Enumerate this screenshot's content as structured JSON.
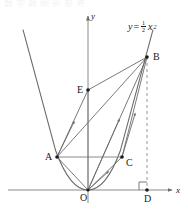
{
  "figure": {
    "type": "coordinate-geometry-diagram",
    "background_color": "#ffffff",
    "stroke_color": "#6b6b6b",
    "text_color": "#1a1a1a",
    "top_cut_text": "数学题图形参考",
    "curve": {
      "equation_label": "y = 1/2 x²",
      "equation_parts": {
        "y": "y",
        "equals": "=",
        "numerator": "1",
        "denominator": "2",
        "variable": "x",
        "exponent": "2"
      },
      "coefficient": 0.5,
      "vertex_point": "O"
    },
    "axes": {
      "x_label": "x",
      "y_label": "y",
      "x_axis_arrow": "arrow-right",
      "y_axis_arrow": "arrow-up"
    },
    "points": [
      {
        "name": "O",
        "label": "O",
        "x": -0.0,
        "y": 0.0,
        "label_pos": "below-left"
      },
      {
        "name": "A",
        "label": "A",
        "x": -2.6,
        "y": 3.3,
        "label_pos": "left"
      },
      {
        "name": "B",
        "label": "B",
        "x": 5.0,
        "y": 13.3,
        "label_pos": "right"
      },
      {
        "name": "C",
        "label": "C",
        "x": 2.8,
        "y": 3.3,
        "label_pos": "right"
      },
      {
        "name": "D",
        "label": "D",
        "x": 5.0,
        "y": 0.0,
        "label_pos": "below"
      },
      {
        "name": "E",
        "label": "E",
        "x": 0.0,
        "y": 10.0,
        "label_pos": "left"
      }
    ],
    "segments": [
      {
        "from": "A",
        "to": "C",
        "style": "solid",
        "arrow": "none"
      },
      {
        "from": "A",
        "to": "B",
        "style": "solid",
        "arrow": "mid"
      },
      {
        "from": "A",
        "to": "E",
        "style": "solid",
        "arrow": "mid"
      },
      {
        "from": "E",
        "to": "B",
        "style": "solid",
        "arrow": "none"
      },
      {
        "from": "O",
        "to": "B",
        "style": "solid",
        "arrow": "mid"
      },
      {
        "from": "O",
        "to": "E",
        "style": "solid",
        "arrow": "none"
      },
      {
        "from": "O",
        "to": "C",
        "style": "solid",
        "arrow": "mid"
      },
      {
        "from": "C",
        "to": "B",
        "style": "solid",
        "arrow": "mid"
      },
      {
        "from": "O",
        "to": "A",
        "style": "solid",
        "arrow": "none"
      },
      {
        "from": "B",
        "to": "D",
        "style": "dashed",
        "arrow": "none"
      }
    ],
    "right_angle_marker": {
      "at": "D",
      "between": [
        "B",
        "x-axis"
      ]
    }
  }
}
